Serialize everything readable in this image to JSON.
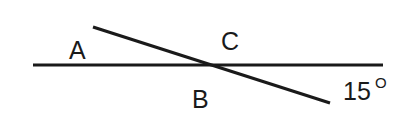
{
  "diagram": {
    "type": "geometry-intersecting-lines",
    "lines": {
      "horizontal": {
        "x1": 33,
        "y1": 65,
        "x2": 383,
        "y2": 65
      },
      "transversal": {
        "x1": 93,
        "y1": 27,
        "x2": 330,
        "y2": 103
      }
    },
    "labels": {
      "a": "A",
      "b": "B",
      "c": "C",
      "angle_value": "15",
      "degree_symbol": "O"
    },
    "colors": {
      "stroke": "#1a1a1a",
      "background": "#ffffff"
    }
  }
}
